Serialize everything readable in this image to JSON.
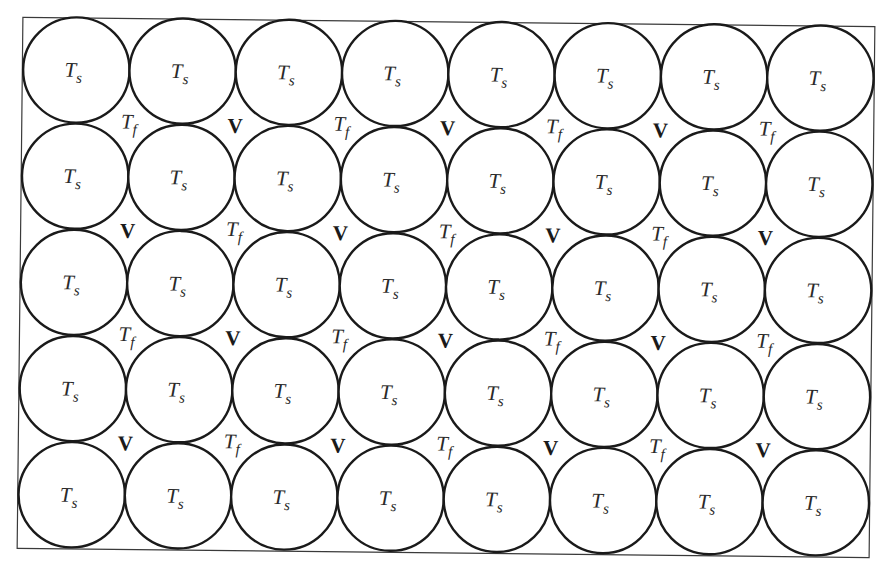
{
  "figure": {
    "grid": {
      "rows": 5,
      "columns": 8
    },
    "colors": {
      "background": "#ffffff",
      "outline": "#1a1a1a",
      "frame": "#3a3a3a",
      "text": "#2a2a2a"
    }
  },
  "labels": {
    "solid": {
      "main": "T",
      "sub": "s",
      "meaning": "solid particle temperature"
    },
    "fluid": {
      "main": "T",
      "sub": "f",
      "meaning": "fluid temperature"
    },
    "void": {
      "text": "V",
      "meaning": "void"
    }
  },
  "particles": [
    [
      "T_s",
      "T_s",
      "T_s",
      "T_s",
      "T_s",
      "T_s",
      "T_s",
      "T_s"
    ],
    [
      "T_s",
      "T_s",
      "T_s",
      "T_s",
      "T_s",
      "T_s",
      "T_s",
      "T_s"
    ],
    [
      "T_s",
      "T_s",
      "T_s",
      "T_s",
      "T_s",
      "T_s",
      "T_s",
      "T_s"
    ],
    [
      "T_s",
      "T_s",
      "T_s",
      "T_s",
      "T_s",
      "T_s",
      "T_s",
      "T_s"
    ],
    [
      "T_s",
      "T_s",
      "T_s",
      "T_s",
      "T_s",
      "T_s",
      "T_s",
      "T_s"
    ]
  ],
  "interstices": [
    [
      "T_f",
      "V",
      "T_f",
      "V",
      "T_f",
      "V",
      "T_f"
    ],
    [
      "V",
      "T_f",
      "V",
      "T_f",
      "V",
      "T_f",
      "V"
    ],
    [
      "T_f",
      "V",
      "T_f",
      "V",
      "T_f",
      "V",
      "T_f"
    ],
    [
      "V",
      "T_f",
      "V",
      "T_f",
      "V",
      "T_f",
      "V"
    ]
  ]
}
